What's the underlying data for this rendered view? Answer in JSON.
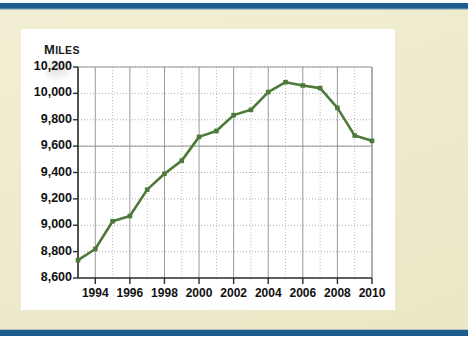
{
  "page": {
    "background_color": "#efecd0",
    "accent_bar_color": "#1e5b8f",
    "card_color": "#ffffff"
  },
  "chart_data": {
    "type": "line",
    "title": "",
    "subtitle": "",
    "ylabel": "Miles",
    "xlabel": "",
    "series_color": "#4e7a39",
    "grid": true,
    "legend": "none",
    "ylim": [
      8600,
      10200
    ],
    "ytick_step": 200,
    "ytick_labels": [
      "10,200",
      "10,000",
      "9,800",
      "9,600",
      "9,400",
      "9,200",
      "9,000",
      "8,800",
      "8,600"
    ],
    "ytick_values": [
      10200,
      10000,
      9800,
      9600,
      9400,
      9200,
      9000,
      8800,
      8600
    ],
    "xlim": [
      1993,
      2010
    ],
    "xtick_labels": [
      "1994",
      "1996",
      "1998",
      "2000",
      "2002",
      "2004",
      "2006",
      "2008",
      "2010"
    ],
    "xtick_values": [
      1994,
      1996,
      1998,
      2000,
      2002,
      2004,
      2006,
      2008,
      2010
    ],
    "x": [
      1993,
      1994,
      1995,
      1996,
      1997,
      1998,
      1999,
      2000,
      2001,
      2002,
      2003,
      2004,
      2005,
      2006,
      2007,
      2008,
      2009,
      2010
    ],
    "values": [
      8735,
      8820,
      9030,
      9070,
      9270,
      9390,
      9490,
      9670,
      9715,
      9835,
      9875,
      10010,
      10085,
      10060,
      10040,
      9890,
      9680,
      9640
    ],
    "series": [
      {
        "name": "Miles",
        "values": [
          8735,
          8820,
          9030,
          9070,
          9270,
          9390,
          9490,
          9670,
          9715,
          9835,
          9875,
          10010,
          10085,
          10060,
          10040,
          9890,
          9680,
          9640
        ]
      }
    ],
    "markers": true,
    "annotations": []
  }
}
